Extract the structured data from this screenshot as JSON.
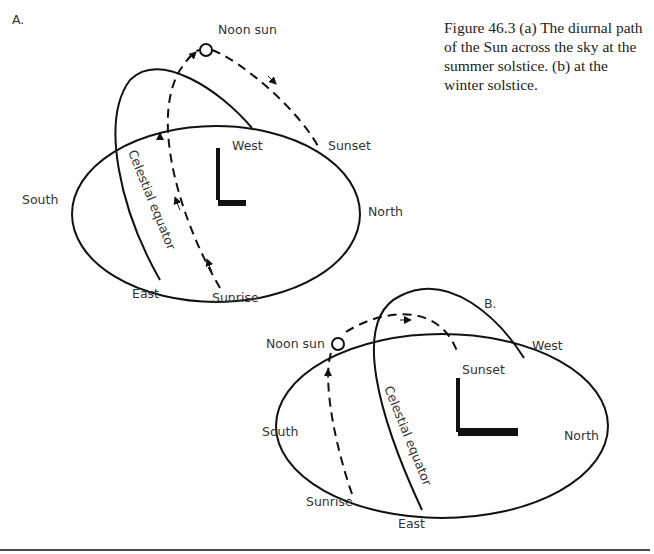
{
  "caption": "Figure 46.3  (a) The diurnal path of the Sun across the sky at the summer solstice.  (b) at the winter solstice.",
  "panel_a": {
    "label": "A.",
    "noon_sun": "Noon sun",
    "west": "West",
    "sunset": "Sunset",
    "south": "South",
    "north": "North",
    "east": "East",
    "sunrise": "Sunrise",
    "equator": "Celestial equator"
  },
  "panel_b": {
    "label": "B.",
    "noon_sun": "Noon sun",
    "west": "West",
    "sunset": "Sunset",
    "south": "South",
    "north": "North",
    "east": "East",
    "sunrise": "Sunrise",
    "equator": "Celestial equator"
  }
}
